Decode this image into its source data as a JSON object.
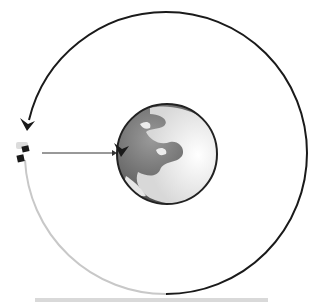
{
  "diagram": {
    "type": "orbit-illustration",
    "orbit": {
      "center": [
        166,
        153
      ],
      "radius": 141,
      "traversed_color": "#1a1a1a",
      "remaining_color": "#c8c8c8"
    },
    "earth": {
      "center": [
        167,
        154
      ],
      "radius": 50,
      "ocean_color": "#6e6e6e",
      "land_color": "#f2f2f2",
      "edge_color": "#222222"
    },
    "satellite": {
      "position": [
        22,
        152
      ],
      "body_color": "#1a1a1a",
      "panel_color": "#dcdcdc"
    },
    "pointer_arrow": {
      "from": [
        42,
        153
      ],
      "to": [
        116,
        153
      ],
      "color": "#333333"
    },
    "direction_arrows": [
      {
        "name": "orbit-direction-arrow",
        "at": [
          28,
          125
        ]
      },
      {
        "name": "earth-rotation-arrow",
        "at": [
          120,
          150
        ]
      }
    ],
    "caption_bar_color": "#d9d9d9"
  }
}
